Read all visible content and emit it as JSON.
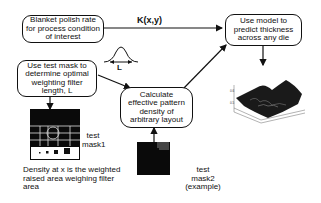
{
  "diagram": {
    "nodes": {
      "blanket": {
        "text": "Blanket polish rate for process condition of interest"
      },
      "test_mask": {
        "text": "Use test mask to determine optimal weighting filter length, L"
      },
      "calculate": {
        "text": "Calculate effective pattern density of arbitrary layout"
      },
      "predict": {
        "text": "Use model to predict thickness across any die"
      }
    },
    "edge_labels": {
      "kernel": "K(x,y)",
      "filter_length": "L"
    },
    "images": {
      "mask1_label": "test mask1",
      "mask2_label": "test mask2 (example)",
      "surface_plot": "3d-thickness-surface"
    },
    "caption": "Density at x is the weighted raised area weighing filter area"
  }
}
